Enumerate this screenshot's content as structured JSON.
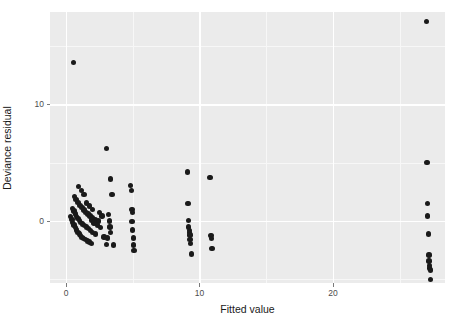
{
  "chart_data": {
    "type": "scatter",
    "title": "",
    "xlabel": "Fitted value",
    "ylabel": "Deviance residual",
    "xlim": [
      -1.2,
      28.4
    ],
    "ylim": [
      -5.3,
      17.9
    ],
    "xticks": [
      0,
      10,
      20
    ],
    "xtick_labels": [
      "0",
      "10",
      "20"
    ],
    "yticks": [
      0,
      10
    ],
    "ytick_labels": [
      "0",
      "10"
    ],
    "grid": true,
    "legend": "none",
    "point_color": "#1a1a1a",
    "panel_color": "#ebebeb",
    "grid_color": "#ffffff",
    "points": [
      [
        0.55,
        13.6
      ],
      [
        0.35,
        0.4
      ],
      [
        0.45,
        0.15
      ],
      [
        0.5,
        -0.1
      ],
      [
        0.6,
        -0.35
      ],
      [
        0.7,
        -0.55
      ],
      [
        0.8,
        -0.75
      ],
      [
        0.9,
        -0.95
      ],
      [
        1.0,
        -1.1
      ],
      [
        1.1,
        -1.25
      ],
      [
        1.2,
        -1.4
      ],
      [
        1.3,
        -1.5
      ],
      [
        1.45,
        -1.6
      ],
      [
        1.6,
        -1.7
      ],
      [
        1.75,
        -1.8
      ],
      [
        1.9,
        -1.9
      ],
      [
        0.5,
        1.1
      ],
      [
        0.6,
        0.85
      ],
      [
        0.7,
        0.6
      ],
      [
        0.8,
        0.4
      ],
      [
        0.9,
        0.2
      ],
      [
        1.0,
        0.05
      ],
      [
        1.1,
        -0.1
      ],
      [
        1.25,
        -0.25
      ],
      [
        1.4,
        -0.4
      ],
      [
        1.55,
        -0.5
      ],
      [
        1.7,
        -0.65
      ],
      [
        1.85,
        -0.8
      ],
      [
        2.0,
        -0.95
      ],
      [
        2.2,
        -1.1
      ],
      [
        0.65,
        2.1
      ],
      [
        0.75,
        1.85
      ],
      [
        0.9,
        1.6
      ],
      [
        1.05,
        1.35
      ],
      [
        1.2,
        1.15
      ],
      [
        1.35,
        0.95
      ],
      [
        1.5,
        0.75
      ],
      [
        1.65,
        0.6
      ],
      [
        1.8,
        0.45
      ],
      [
        2.0,
        0.3
      ],
      [
        2.2,
        0.15
      ],
      [
        2.45,
        0.0
      ],
      [
        0.95,
        2.95
      ],
      [
        1.15,
        2.6
      ],
      [
        1.35,
        2.3
      ],
      [
        1.55,
        1.55
      ],
      [
        1.75,
        1.3
      ],
      [
        2.0,
        1.0
      ],
      [
        1.9,
        0.1
      ],
      [
        2.1,
        -0.15
      ],
      [
        2.35,
        -0.35
      ],
      [
        2.6,
        -0.55
      ],
      [
        2.5,
        0.75
      ],
      [
        2.7,
        0.45
      ],
      [
        2.85,
        -1.35
      ],
      [
        3.1,
        -1.45
      ],
      [
        3.05,
        6.2
      ],
      [
        3.35,
        3.6
      ],
      [
        3.45,
        2.3
      ],
      [
        3.2,
        0.55
      ],
      [
        3.25,
        0.0
      ],
      [
        3.3,
        -0.5
      ],
      [
        3.35,
        -0.95
      ],
      [
        3.05,
        -2.0
      ],
      [
        3.55,
        -2.05
      ],
      [
        4.85,
        3.05
      ],
      [
        4.9,
        2.6
      ],
      [
        4.95,
        1.0
      ],
      [
        5.0,
        0.75
      ],
      [
        4.95,
        -0.05
      ],
      [
        5.0,
        -0.75
      ],
      [
        5.05,
        -1.45
      ],
      [
        5.05,
        -2.05
      ],
      [
        5.1,
        -2.5
      ],
      [
        9.1,
        4.2
      ],
      [
        9.15,
        1.5
      ],
      [
        9.2,
        0.05
      ],
      [
        9.2,
        -0.5
      ],
      [
        9.25,
        -0.8
      ],
      [
        9.25,
        -1.0
      ],
      [
        9.3,
        -1.2
      ],
      [
        9.3,
        -1.6
      ],
      [
        9.35,
        -1.9
      ],
      [
        9.4,
        -2.8
      ],
      [
        10.8,
        3.75
      ],
      [
        10.85,
        -1.25
      ],
      [
        10.9,
        -1.5
      ],
      [
        10.95,
        -2.35
      ],
      [
        27.0,
        17.1
      ],
      [
        27.05,
        5.0
      ],
      [
        27.1,
        1.5
      ],
      [
        27.1,
        0.45
      ],
      [
        27.15,
        -1.1
      ],
      [
        27.2,
        -2.9
      ],
      [
        27.2,
        -3.4
      ],
      [
        27.25,
        -3.8
      ],
      [
        27.25,
        -4.0
      ],
      [
        27.3,
        -4.2
      ],
      [
        27.3,
        -5.0
      ]
    ]
  }
}
